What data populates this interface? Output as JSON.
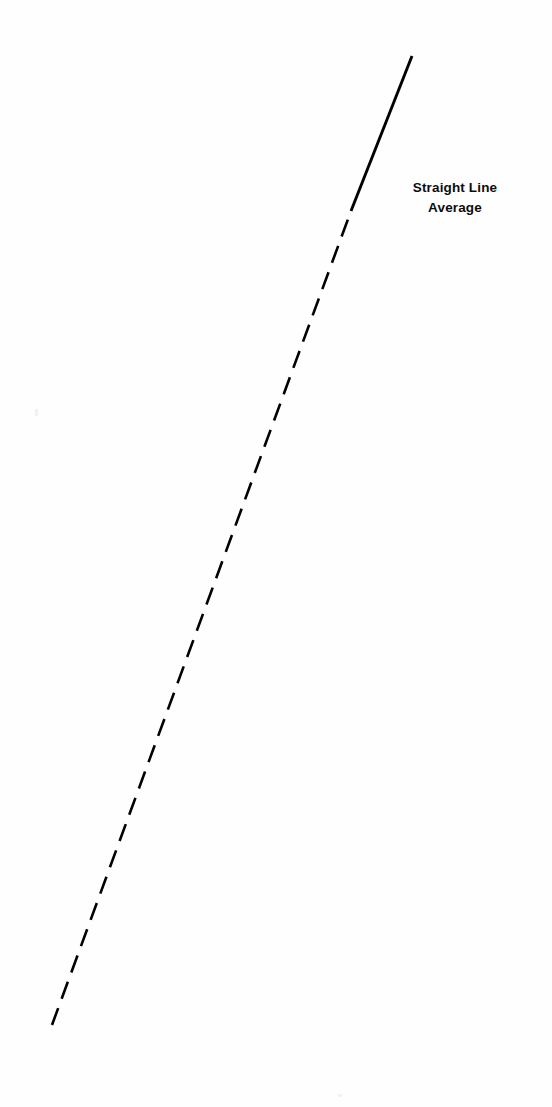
{
  "figure": {
    "background_color": "#ffffff",
    "width": 552,
    "height": 1107,
    "label": {
      "line1": "Straight Line",
      "line2": "Average"
    }
  },
  "chart_data": {
    "type": "line",
    "title": "",
    "subtitle": "",
    "xlabel": "",
    "ylabel": "",
    "grid": false,
    "legend_position": "inline-right-of-line",
    "axis_visible": false,
    "tick_labels": {
      "x": [],
      "y": []
    },
    "annotations": [
      {
        "text": "Straight Line Average",
        "lines": [
          "Straight Line",
          "Average"
        ],
        "x_px": 455,
        "y_px": 196,
        "align": "center",
        "bold": true,
        "color": "#0d0d0d",
        "font_size_px": 13.5
      }
    ],
    "series": [
      {
        "name": "Straight Line Average",
        "color": "#000000",
        "line_width_px": 2.6,
        "description": "Single monotonically rising straight trend line; lower portion drawn dashed (extrapolated/average region), upper portion drawn solid.",
        "x": [
          52,
          412
        ],
        "y": [
          1025,
          56
        ],
        "segments": [
          {
            "style": "dashed",
            "dash_px": 18,
            "gap_px": 10,
            "x_start_px": 52,
            "y_start_px": 1025,
            "x_end_px": 351,
            "y_end_px": 211
          },
          {
            "style": "solid",
            "x_start_px": 351,
            "y_start_px": 211,
            "x_end_px": 412,
            "y_end_px": 56
          }
        ]
      }
    ],
    "geometry_notes": {
      "origin_corner": "bottom-left",
      "direction": "ascending left-to-right",
      "slope_px_per_px": -2.692,
      "dash_fraction_of_length": 0.84
    }
  }
}
